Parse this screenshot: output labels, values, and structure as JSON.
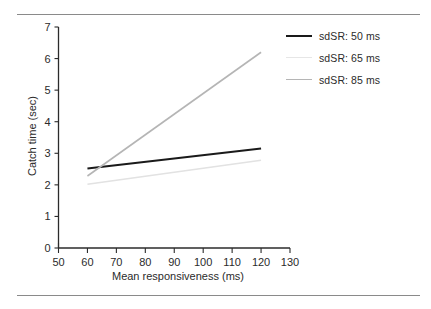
{
  "figure": {
    "background": "#ffffff",
    "rule_color": "#8a8a8a",
    "top_rule": "",
    "bottom_rule": ""
  },
  "chart_data": {
    "type": "line",
    "title": "",
    "xlabel": "Mean responsiveness (ms)",
    "ylabel": "Catch time (sec)",
    "xlim": [
      50,
      130
    ],
    "ylim": [
      0,
      7
    ],
    "xticks": [
      50,
      60,
      70,
      80,
      90,
      100,
      110,
      120,
      130
    ],
    "xticklabels": [
      "50",
      "60",
      "70",
      "80",
      "90",
      "100",
      "110",
      "120",
      "130"
    ],
    "yticks": [
      0,
      1,
      2,
      3,
      4,
      5,
      6,
      7
    ],
    "yticklabels": [
      "0",
      "1",
      "2",
      "3",
      "4",
      "5",
      "6",
      "7"
    ],
    "grid": false,
    "legend_position": "upper right",
    "series": [
      {
        "name": "sdSR: 50 ms",
        "color": "#1a1a1a",
        "width": 2.0,
        "x": [
          60,
          120
        ],
        "values": [
          2.52,
          3.15
        ]
      },
      {
        "name": "sdSR: 65 ms",
        "color": "#e2e2e2",
        "width": 1.6,
        "x": [
          60,
          120
        ],
        "values": [
          2.02,
          2.78
        ]
      },
      {
        "name": "sdSR: 85 ms",
        "color": "#b5b5b5",
        "width": 1.6,
        "x": [
          60,
          120
        ],
        "values": [
          2.28,
          6.2
        ]
      }
    ]
  },
  "legend": {
    "items": [
      {
        "label": "sdSR: 50 ms",
        "color": "#1a1a1a",
        "width": "2px"
      },
      {
        "label": "sdSR: 65 ms",
        "color": "#e6e6e6",
        "width": "1.5px"
      },
      {
        "label": "sdSR: 85 ms",
        "color": "#b5b5b5",
        "width": "1.5px"
      }
    ]
  }
}
